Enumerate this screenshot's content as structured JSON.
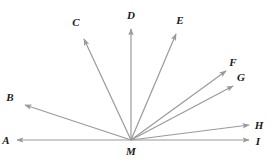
{
  "figure": {
    "type": "ray-diagram",
    "background_color": "#ffffff",
    "stroke_color": "#9a9a9a",
    "label_color": "#1a1a1a",
    "stroke_width": 1.2,
    "width": 270,
    "height": 160
  },
  "vertex": {
    "label": "M",
    "x": 131,
    "y": 140,
    "label_x": 131,
    "label_y": 151
  },
  "rays": [
    {
      "label": "A",
      "from_x": 131,
      "from_y": 140,
      "to_x": 17,
      "to_y": 140,
      "label_x": 6,
      "label_y": 140,
      "angle_deg": 180
    },
    {
      "label": "B",
      "from_x": 131,
      "from_y": 140,
      "to_x": 25,
      "to_y": 105,
      "label_x": 10,
      "label_y": 97,
      "angle_deg": 162
    },
    {
      "label": "C",
      "from_x": 131,
      "from_y": 140,
      "to_x": 84,
      "to_y": 39,
      "label_x": 76,
      "label_y": 22,
      "angle_deg": 115
    },
    {
      "label": "D",
      "from_x": 131,
      "from_y": 140,
      "to_x": 131,
      "to_y": 29,
      "label_x": 131,
      "label_y": 15,
      "angle_deg": 90
    },
    {
      "label": "E",
      "from_x": 131,
      "from_y": 140,
      "to_x": 176,
      "to_y": 34,
      "label_x": 180,
      "label_y": 20,
      "angle_deg": 67
    },
    {
      "label": "F",
      "from_x": 131,
      "from_y": 140,
      "to_x": 226,
      "to_y": 71,
      "label_x": 233,
      "label_y": 62,
      "angle_deg": 36
    },
    {
      "label": "G",
      "from_x": 131,
      "from_y": 140,
      "to_x": 233,
      "to_y": 86,
      "label_x": 241,
      "label_y": 77,
      "angle_deg": 28
    },
    {
      "label": "H",
      "from_x": 131,
      "from_y": 140,
      "to_x": 249,
      "to_y": 125,
      "label_x": 259,
      "label_y": 125,
      "angle_deg": 7
    },
    {
      "label": "I",
      "from_x": 131,
      "from_y": 140,
      "to_x": 249,
      "to_y": 140,
      "label_x": 258,
      "label_y": 141,
      "angle_deg": 0
    }
  ]
}
